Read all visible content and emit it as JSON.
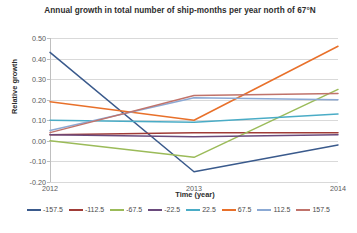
{
  "chart_data": {
    "type": "line",
    "title": "Annual growth in total number of ship-months per year north of 67°N",
    "xlabel": "Time (year)",
    "ylabel": "Relative growth",
    "x": [
      2012,
      2013,
      2014
    ],
    "xtick_labels": [
      "2012",
      "2013",
      "2014"
    ],
    "ytick_labels": [
      "0.50",
      "0.40",
      "0.30",
      "0.20",
      "0.10",
      "0.00",
      "-0.10",
      "-0.20"
    ],
    "ytick_values": [
      0.5,
      0.4,
      0.3,
      0.2,
      0.1,
      0,
      -0.1,
      -0.2
    ],
    "ylim": [
      -0.2,
      0.5
    ],
    "xlim": [
      2012,
      2014
    ],
    "grid": true,
    "legend_position": "bottom",
    "series": [
      {
        "name": "-157.5",
        "color": "#3a5a8c",
        "values": [
          0.43,
          -0.15,
          -0.02
        ]
      },
      {
        "name": "-112.5",
        "color": "#a03c37",
        "values": [
          0.03,
          0.04,
          0.04
        ]
      },
      {
        "name": "-67.5",
        "color": "#9bbb59",
        "values": [
          0.0,
          -0.08,
          0.25
        ]
      },
      {
        "name": "-22.5",
        "color": "#6a4a7c",
        "values": [
          0.03,
          0.02,
          0.03
        ]
      },
      {
        "name": "22.5",
        "color": "#4aacc6",
        "values": [
          0.1,
          0.09,
          0.13
        ]
      },
      {
        "name": "67.5",
        "color": "#e8702a",
        "values": [
          0.19,
          0.1,
          0.46
        ]
      },
      {
        "name": "112.5",
        "color": "#8ba9d4",
        "values": [
          0.05,
          0.21,
          0.2
        ]
      },
      {
        "name": "157.5",
        "color": "#c0736b",
        "values": [
          0.04,
          0.22,
          0.23
        ]
      }
    ]
  }
}
